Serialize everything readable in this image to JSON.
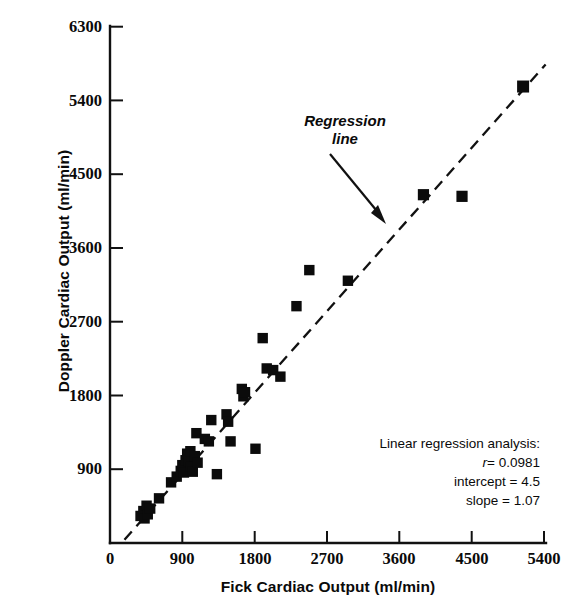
{
  "chart_data": {
    "type": "scatter",
    "title": "",
    "xlabel": "Fick Cardiac Output (ml/min)",
    "ylabel": "Doppler Cardiac Output (ml/min)",
    "xlim": [
      0,
      5400
    ],
    "ylim": [
      0,
      6300
    ],
    "xticks": [
      0,
      900,
      1800,
      2700,
      3600,
      4500,
      5400
    ],
    "xticklabels": [
      "0",
      "900",
      "1800",
      "2700",
      "3600",
      "4500",
      "5400"
    ],
    "yticks": [
      0,
      900,
      1800,
      2700,
      3600,
      4500,
      5400,
      6300
    ],
    "yticklabels": [
      "0",
      "900",
      "1800",
      "2700",
      "3600",
      "4500",
      "5400",
      "6300"
    ],
    "grid": false,
    "legend": false,
    "marker": "square",
    "marker_color": "#0b0b0b",
    "series": [
      {
        "name": "Doppler vs Fick cardiac output",
        "points": [
          [
            380,
            330
          ],
          [
            415,
            390
          ],
          [
            430,
            300
          ],
          [
            455,
            455
          ],
          [
            470,
            350
          ],
          [
            500,
            420
          ],
          [
            610,
            545
          ],
          [
            760,
            740
          ],
          [
            830,
            810
          ],
          [
            880,
            880
          ],
          [
            900,
            950
          ],
          [
            920,
            860
          ],
          [
            940,
            1010
          ],
          [
            960,
            1090
          ],
          [
            985,
            1000
          ],
          [
            1000,
            1120
          ],
          [
            1005,
            930
          ],
          [
            1030,
            870
          ],
          [
            1055,
            1060
          ],
          [
            1075,
            1340
          ],
          [
            1090,
            980
          ],
          [
            1180,
            1270
          ],
          [
            1230,
            1240
          ],
          [
            1260,
            1500
          ],
          [
            1330,
            840
          ],
          [
            1450,
            1570
          ],
          [
            1470,
            1480
          ],
          [
            1500,
            1240
          ],
          [
            1640,
            1880
          ],
          [
            1660,
            1790
          ],
          [
            1680,
            1840
          ],
          [
            1810,
            1150
          ],
          [
            1900,
            2500
          ],
          [
            1950,
            2130
          ],
          [
            2030,
            2110
          ],
          [
            2120,
            2030
          ],
          [
            2320,
            2890
          ],
          [
            2480,
            3330
          ],
          [
            2960,
            3200
          ],
          [
            3900,
            4250
          ],
          [
            4380,
            4230
          ],
          [
            5140,
            5570
          ]
        ]
      }
    ],
    "regression_line": {
      "label_line1": "Regression",
      "label_line2": "line",
      "style": "dashed",
      "x_start": 180,
      "y_start": 40,
      "x_end": 5420,
      "y_end": 5840
    },
    "annotations": {
      "heading": "Linear regression analysis:",
      "r_label": "r",
      "r_value": "= 0.0981",
      "intercept": "intercept = 4.5",
      "slope": "slope = 1.07"
    }
  }
}
